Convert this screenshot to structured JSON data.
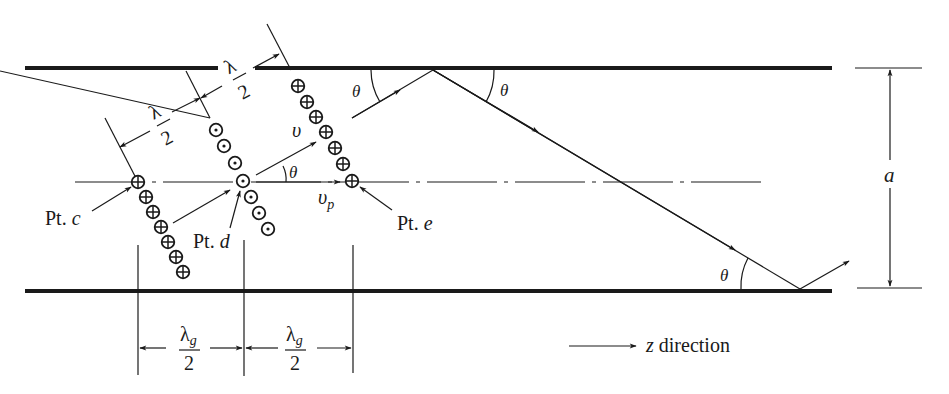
{
  "figure": {
    "type": "waveguide-plane-wave-reflection-diagram",
    "colors": {
      "ink": "#1a1a1a",
      "background": "#ffffff"
    }
  },
  "labels": {
    "lambda_half_top": {
      "num": "λ",
      "den": "2"
    },
    "lambda_half_left": {
      "num": "λ",
      "den": "2"
    },
    "theta": "θ",
    "v": "υ",
    "vp_main": "υ",
    "vp_sub": "p",
    "pt_c_prefix": "Pt.",
    "pt_c_name": "c",
    "pt_d_prefix": "Pt.",
    "pt_d_name": "d",
    "pt_e_prefix": "Pt.",
    "pt_e_name": "e",
    "a": "a",
    "lambda_g_left": {
      "num_main": "λ",
      "num_sub": "g",
      "den": "2"
    },
    "lambda_g_right": {
      "num_main": "λ",
      "num_sub": "g",
      "den": "2"
    },
    "z_var": "z",
    "z_text": "direction"
  },
  "wavefronts": [
    {
      "name": "wavefront-c",
      "symbol": "cross-in-circle",
      "meaning": "field into page",
      "count": 7
    },
    {
      "name": "wavefront-d",
      "symbol": "dot-in-circle",
      "meaning": "field out of page",
      "count": 7
    },
    {
      "name": "wavefront-e",
      "symbol": "cross-in-circle",
      "meaning": "field into page",
      "count": 7
    }
  ]
}
